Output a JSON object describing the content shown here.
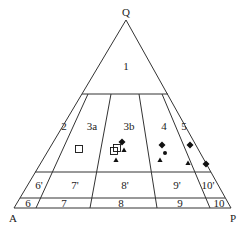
{
  "diagram": {
    "type": "ternary-classification",
    "vertices": {
      "top": "Q",
      "bottom_left": "A",
      "bottom_right": "P"
    },
    "fields": {
      "f1": "1",
      "f2": "2",
      "f3a": "3a",
      "f3b": "3b",
      "f4": "4",
      "f5": "5",
      "f6p": "6'",
      "f7p": "7'",
      "f8p": "8'",
      "f9p": "9'",
      "f10p": "10'",
      "f6": "6",
      "f7": "7",
      "f8": "8",
      "f9": "9",
      "f10": "10"
    },
    "markers": {
      "open_square": [
        [
          79,
          149
        ],
        [
          114,
          151
        ],
        [
          117,
          148
        ]
      ],
      "filled_diamond": [
        [
          122,
          142
        ],
        [
          162,
          145
        ],
        [
          190,
          145
        ],
        [
          206,
          164
        ]
      ],
      "filled_triangle": [
        [
          124,
          150
        ],
        [
          116,
          160
        ],
        [
          160,
          160
        ],
        [
          188,
          163
        ]
      ],
      "filled_dot": [
        [
          165,
          153
        ]
      ]
    },
    "colors": {
      "line": "#333333",
      "marker": "#111111",
      "background": "#ffffff"
    }
  }
}
